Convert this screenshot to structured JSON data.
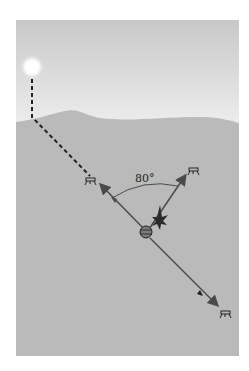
{
  "figure": {
    "angle_label": "80°",
    "elements": {
      "sun": "sun-icon",
      "hive": "hive-icon",
      "bees": [
        "bee-icon-left",
        "bee-icon-right",
        "bee-icon-lower-right"
      ],
      "dance_bee": "dancing-bee-icon"
    },
    "colors": {
      "sky_top": "#c9c9c9",
      "sky_bottom": "#eeeeee",
      "ground": "#b9b9b9",
      "line": "#4a4a4a",
      "dash": "#1f1f1f",
      "background": "#ffffff"
    }
  }
}
